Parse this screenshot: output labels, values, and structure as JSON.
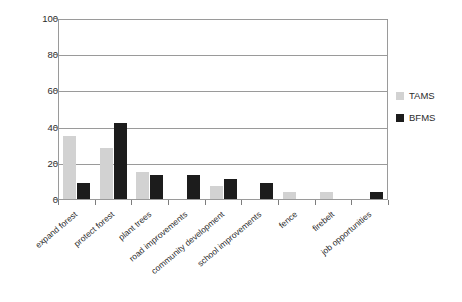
{
  "chart_data": {
    "type": "bar",
    "title": "",
    "xlabel": "",
    "ylabel": "Percentage of Responses",
    "ylim": [
      0,
      100
    ],
    "yticks": [
      0,
      20,
      40,
      60,
      80,
      100
    ],
    "grid": true,
    "legend_position": "right",
    "categories": [
      "expand forest",
      "protect forest",
      "plant trees",
      "road improvements",
      "community development",
      "school improvements",
      "fence",
      "firebelt",
      "job opportunities"
    ],
    "series": [
      {
        "name": "TAMS",
        "color": "#d2d2d2",
        "values": [
          35,
          28,
          15,
          0,
          7,
          0,
          4,
          4,
          0
        ]
      },
      {
        "name": "BFMS",
        "color": "#1c1c1c",
        "values": [
          9,
          42,
          13,
          13,
          11,
          9,
          0,
          0,
          4
        ]
      }
    ]
  },
  "axis": {
    "y_title": "Percentage of Responses",
    "y_tick_labels": [
      "0",
      "20",
      "40",
      "60",
      "80",
      "100"
    ]
  },
  "legend": {
    "items": [
      {
        "label": "TAMS",
        "color": "#d2d2d2"
      },
      {
        "label": "BFMS",
        "color": "#1c1c1c"
      }
    ]
  }
}
